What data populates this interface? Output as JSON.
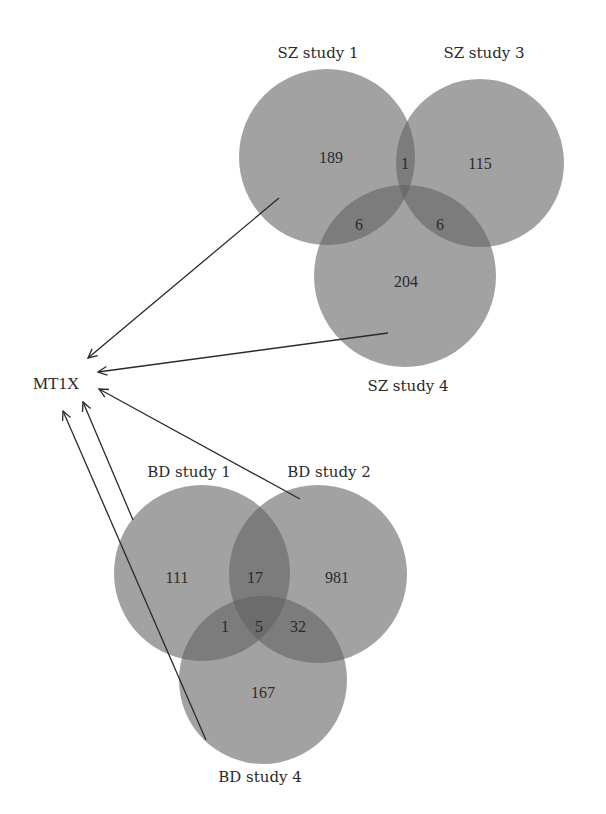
{
  "chart_data": {
    "type": "venn",
    "title": "",
    "target_gene": "MT1X",
    "colors": {
      "circle": "#a2a2a2",
      "circle_opacity": 0.95,
      "overlap": "#7c7c7c",
      "triple": "#6c6c6c",
      "text": "#2a2a2a",
      "arrow": "#2a2a2a"
    },
    "diagrams": [
      {
        "name": "SZ",
        "sets": [
          {
            "label": "SZ study 1",
            "cx": 327,
            "cy": 157,
            "r": 88,
            "label_x": 318,
            "label_y": 58
          },
          {
            "label": "SZ study 3",
            "cx": 480,
            "cy": 163,
            "r": 84,
            "label_x": 484,
            "label_y": 58
          },
          {
            "label": "SZ study 4",
            "cx": 405,
            "cy": 276,
            "r": 91,
            "label_x": 408,
            "label_y": 391
          }
        ],
        "regions": [
          {
            "sets": [
              "SZ study 1"
            ],
            "value": "189",
            "x": 331,
            "y": 163
          },
          {
            "sets": [
              "SZ study 3"
            ],
            "value": "115",
            "x": 480,
            "y": 169
          },
          {
            "sets": [
              "SZ study 4"
            ],
            "value": "204",
            "x": 406,
            "y": 287
          },
          {
            "sets": [
              "SZ study 1",
              "SZ study 3"
            ],
            "value": "1",
            "x": 405,
            "y": 169
          },
          {
            "sets": [
              "SZ study 1",
              "SZ study 4"
            ],
            "value": "6",
            "x": 359,
            "y": 230
          },
          {
            "sets": [
              "SZ study 3",
              "SZ study 4"
            ],
            "value": "6",
            "x": 440,
            "y": 230
          }
        ]
      },
      {
        "name": "BD",
        "sets": [
          {
            "label": "BD study 1",
            "cx": 202,
            "cy": 573,
            "r": 88,
            "label_x": 189,
            "label_y": 477
          },
          {
            "label": "BD study 2",
            "cx": 318,
            "cy": 574,
            "r": 89,
            "label_x": 329,
            "label_y": 477
          },
          {
            "label": "BD study 4",
            "cx": 263,
            "cy": 680,
            "r": 84,
            "label_x": 260,
            "label_y": 782
          }
        ],
        "regions": [
          {
            "sets": [
              "BD study 1"
            ],
            "value": "111",
            "x": 177,
            "y": 583
          },
          {
            "sets": [
              "BD study 2"
            ],
            "value": "981",
            "x": 337,
            "y": 583
          },
          {
            "sets": [
              "BD study 4"
            ],
            "value": "167",
            "x": 263,
            "y": 698
          },
          {
            "sets": [
              "BD study 1",
              "BD study 2"
            ],
            "value": "17",
            "x": 255,
            "y": 583
          },
          {
            "sets": [
              "BD study 1",
              "BD study 4"
            ],
            "value": "1",
            "x": 225,
            "y": 632
          },
          {
            "sets": [
              "BD study 2",
              "BD study 4"
            ],
            "value": "32",
            "x": 298,
            "y": 632
          },
          {
            "sets": [
              "BD study 1",
              "BD study 2",
              "BD study 4"
            ],
            "value": "5",
            "x": 259,
            "y": 632
          }
        ]
      }
    ],
    "gene_label": {
      "text": "MT1X",
      "x": 33,
      "y": 389
    },
    "arrows": [
      {
        "from": "SZ study 1",
        "x1": 279,
        "y1": 198,
        "x2": 88,
        "y2": 358
      },
      {
        "from": "SZ study 4",
        "x1": 388,
        "y1": 333,
        "x2": 98,
        "y2": 372
      },
      {
        "from": "BD study 2",
        "x1": 300,
        "y1": 499,
        "x2": 99,
        "y2": 389
      },
      {
        "from": "BD study 1",
        "x1": 133,
        "y1": 520,
        "x2": 83,
        "y2": 402
      },
      {
        "from": "BD study 4",
        "x1": 206,
        "y1": 740,
        "x2": 63,
        "y2": 411
      }
    ]
  }
}
